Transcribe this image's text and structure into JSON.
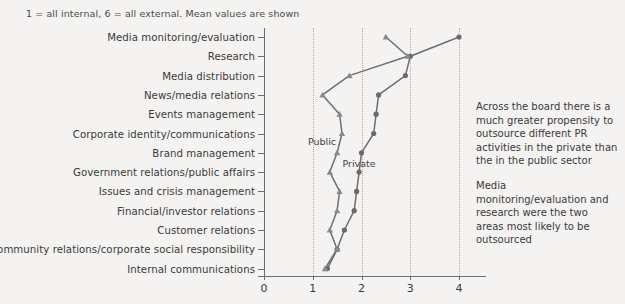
{
  "note": "1 = all internal, 6 = all external. Mean values are shown",
  "commentary": [
    "Across the board there is a much greater propensity to outsource different PR activities in the private than the in the public sector",
    "Media monitoring/evaluation and research were the two areas most likely to be outsourced"
  ],
  "series_labels": {
    "public": "Public",
    "private": "Private"
  },
  "chart_data": {
    "type": "line",
    "orientation": "horizontal",
    "title": "",
    "subtitle": "1 = all internal, 6 = all external. Mean values are shown",
    "xlabel": "",
    "ylabel": "",
    "xlim": [
      0,
      4.4
    ],
    "xticks": [
      0,
      1,
      2,
      3,
      4
    ],
    "xtick_labels": [
      "0",
      "1",
      "2",
      "3",
      "4"
    ],
    "grid": "vertical-dotted",
    "legend": "inline-annotations",
    "categories": [
      "Media monitoring/evaluation",
      "Research",
      "Media distribution",
      "News/media relations",
      "Events management",
      "Corporate identity/communications",
      "Brand management",
      "Government relations/public affairs",
      "Issues and crisis management",
      "Financial/investor relations",
      "Customer relations",
      "Community relations/corporate social responsibility",
      "Internal communications"
    ],
    "series": [
      {
        "name": "Private",
        "marker": "circle",
        "color": "#6a6a6a",
        "values": [
          4.0,
          3.0,
          2.9,
          2.35,
          2.3,
          2.25,
          2.0,
          1.95,
          1.9,
          1.85,
          1.65,
          1.5,
          1.3
        ]
      },
      {
        "name": "Public",
        "marker": "triangle",
        "color": "#8a8a8a",
        "values": [
          2.5,
          2.95,
          1.75,
          1.2,
          1.55,
          1.6,
          1.5,
          1.35,
          1.55,
          1.5,
          1.35,
          1.5,
          1.25
        ]
      }
    ]
  }
}
